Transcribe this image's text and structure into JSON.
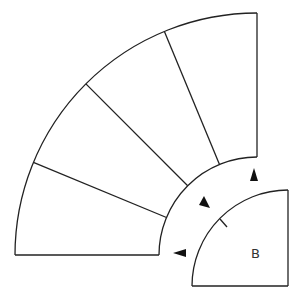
{
  "diagram": {
    "type": "geometric-figure",
    "large_sector": {
      "segments": 4,
      "angle_deg": 90
    },
    "small_sector": {
      "label": "B",
      "angle_deg": 90
    },
    "arrows": [
      {
        "name": "arrow-up",
        "direction": "up"
      },
      {
        "name": "arrow-diagonal",
        "direction": "down-right"
      },
      {
        "name": "arrow-left",
        "direction": "left"
      }
    ],
    "colors": {
      "stroke": "#222222",
      "arrow": "#111111",
      "background": "#ffffff"
    }
  }
}
